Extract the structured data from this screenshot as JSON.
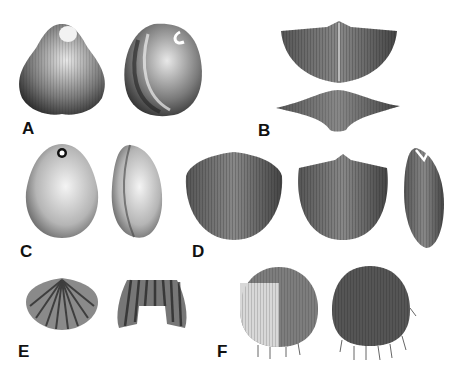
{
  "figure": {
    "type": "illustration-plate",
    "panels": [
      {
        "label": "A",
        "views": [
          "dorsal view",
          "lateral view"
        ],
        "x": 22,
        "y": 120
      },
      {
        "label": "B",
        "views": [
          "dorsal view",
          "anterior view"
        ],
        "x": 258,
        "y": 122
      },
      {
        "label": "C",
        "views": [
          "dorsal view",
          "lateral view"
        ],
        "x": 20,
        "y": 243
      },
      {
        "label": "D",
        "views": [
          "ventral view",
          "dorsal view",
          "lateral view"
        ],
        "x": 192,
        "y": 243
      },
      {
        "label": "E",
        "views": [
          "dorsal view",
          "anterior view"
        ],
        "x": 18,
        "y": 343
      },
      {
        "label": "F",
        "views": [
          "dorsal view",
          "ventral view"
        ],
        "x": 217,
        "y": 343
      }
    ]
  },
  "colors": {
    "background": "#ffffff",
    "ink": "#111111",
    "shell_dark": "#2a2a2a",
    "shell_mid": "#6b6b6b",
    "shell_light": "#d9d9d9"
  }
}
